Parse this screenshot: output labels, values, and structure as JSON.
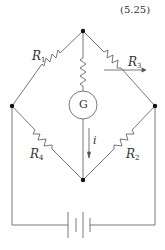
{
  "equation_number": "(5.25)",
  "labels": {
    "r1": {
      "letter": "R",
      "sub": "1"
    },
    "r2": {
      "letter": "R",
      "sub": "2"
    },
    "r3": {
      "letter": "R",
      "sub": "3"
    },
    "r4": {
      "letter": "R",
      "sub": "4"
    },
    "galvanometer": "G",
    "current": "i"
  },
  "colors": {
    "line": "#555555",
    "node": "#111111"
  }
}
